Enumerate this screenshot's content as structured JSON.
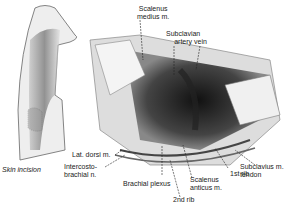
{
  "figure": {
    "labels": {
      "scalenus_medius": "Scalenus\nmedius m.",
      "subclavian_artery": "Subclavian\nartery",
      "subclavian_vein": "vein",
      "lat_dorsi": "Lat. dorsi m.",
      "intercostobrachial": "Intercosto-\nbrachial n.",
      "brachial_plexus": "Brachial plexus",
      "second_rib": "2nd rib",
      "scalenus_anticus": "Scalenus\nanticus m.",
      "first_rib": "1st rib",
      "subclavius_tendon": "Subclavius m.\ntendon",
      "skin_incision": "Skin incision"
    },
    "colors": {
      "ink": "#222222",
      "shade": "#555555",
      "background": "#ffffff"
    }
  }
}
